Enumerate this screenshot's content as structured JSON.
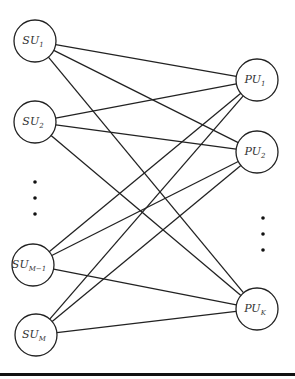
{
  "diagram": {
    "type": "bipartite-graph",
    "colors": {
      "stroke": "#222222",
      "node_fill": "#ffffff",
      "text": "#333333"
    },
    "left_nodes": [
      {
        "id": "su1",
        "main": "SU",
        "sub": "1",
        "cx": 35,
        "cy": 41
      },
      {
        "id": "su2",
        "main": "SU",
        "sub": "2",
        "cx": 35,
        "cy": 122
      },
      {
        "id": "suM1",
        "main": "SU",
        "sub": "M−1",
        "cx": 33,
        "cy": 265
      },
      {
        "id": "suM",
        "main": "SU",
        "sub": "M",
        "cx": 36,
        "cy": 335
      }
    ],
    "right_nodes": [
      {
        "id": "pu1",
        "main": "PU",
        "sub": "1",
        "cx": 257,
        "cy": 80
      },
      {
        "id": "pu2",
        "main": "PU",
        "sub": "2",
        "cx": 257,
        "cy": 152
      },
      {
        "id": "puK",
        "main": "PU",
        "sub": "K",
        "cx": 257,
        "cy": 309
      }
    ],
    "node_radius": 21,
    "left_ellipsis": {
      "x": 35,
      "ys": [
        182,
        198,
        214
      ]
    },
    "right_ellipsis": {
      "x": 263,
      "ys": [
        218,
        234,
        250
      ]
    },
    "edges": "complete-bipartite"
  }
}
